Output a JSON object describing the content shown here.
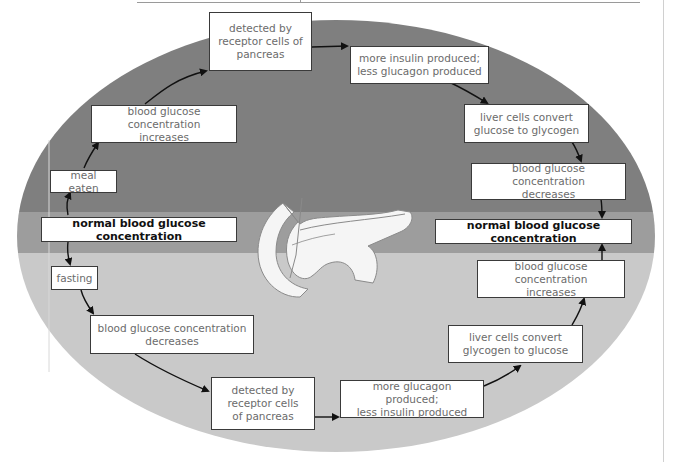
{
  "diagram": {
    "colors": {
      "upper_band": "#7f7f7f",
      "middle_band": "#9d9d9d",
      "lower_band": "#c9c9c9",
      "box_fill": "#ffffff",
      "box_border": "#3a3a3a",
      "text": "#6b6b6b",
      "bold_text": "#111111",
      "arrow": "#111111"
    },
    "upper_cycle": {
      "boxes": [
        {
          "id": "meal-eaten",
          "label": "meal eaten"
        },
        {
          "id": "bg-increases-top",
          "label": "blood glucose concentration\nincreases"
        },
        {
          "id": "detected-top",
          "label": "detected by\nreceptor cells of\npancreas"
        },
        {
          "id": "more-insulin",
          "label": "more insulin produced;\nless glucagon produced"
        },
        {
          "id": "liver-glucose-to-glycogen",
          "label": "liver cells convert\nglucose to glycogen"
        },
        {
          "id": "bg-decreases-top",
          "label": "blood glucose concentration\ndecreases"
        }
      ]
    },
    "normal": {
      "left": "normal blood glucose concentration",
      "right": "normal blood glucose concentration"
    },
    "lower_cycle": {
      "boxes": [
        {
          "id": "fasting",
          "label": "fasting"
        },
        {
          "id": "bg-decreases-bottom",
          "label": "blood glucose concentration\ndecreases"
        },
        {
          "id": "detected-bottom",
          "label": "detected by\nreceptor cells\nof pancreas"
        },
        {
          "id": "more-glucagon",
          "label": "more glucagon produced;\nless insulin produced"
        },
        {
          "id": "liver-glycogen-to-glucose",
          "label": "liver cells convert\nglycogen to glucose"
        },
        {
          "id": "bg-increases-bottom",
          "label": "blood glucose concentration\nincreases"
        }
      ]
    },
    "illustration": {
      "icon": "pancreas-illustration"
    }
  }
}
